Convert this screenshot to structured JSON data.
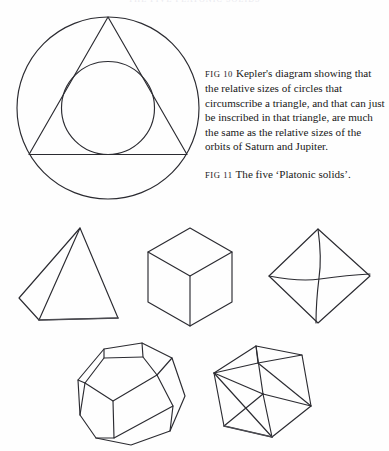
{
  "page": {
    "background_color": "#fefefe",
    "ink_color": "#2b2b31",
    "running_head": "THE FIVE PLATONIC SOLIDS"
  },
  "captions": [
    {
      "label": "FIG 10",
      "text": "Kepler's diagram showing that the relative sizes of circles that circumscribe a triangle, and that can just be inscribed in that triangle, are much the same as the relative sizes of the orbits of Saturn and Jupiter."
    },
    {
      "label": "FIG 11",
      "text": "The five ‘Platonic solids’."
    }
  ],
  "figure_10": {
    "name": "kepler-circle-triangle-diagram",
    "elements": [
      {
        "shape": "outer-circle",
        "cx": 100,
        "cy": 100,
        "r": 91
      },
      {
        "shape": "inscribed-triangle",
        "points": "100,9 179,146 21,146"
      },
      {
        "shape": "inner-circle",
        "cx": 100,
        "cy": 100,
        "r": 46
      }
    ]
  },
  "figure_11": {
    "name": "five-platonic-solids",
    "solids": [
      {
        "name": "tetrahedron",
        "faces": 4,
        "face_shape": "triangle"
      },
      {
        "name": "cube",
        "faces": 6,
        "face_shape": "square"
      },
      {
        "name": "octahedron",
        "faces": 8,
        "face_shape": "triangle"
      },
      {
        "name": "dodecahedron",
        "faces": 12,
        "face_shape": "pentagon"
      },
      {
        "name": "icosahedron",
        "faces": 20,
        "face_shape": "triangle"
      }
    ]
  }
}
